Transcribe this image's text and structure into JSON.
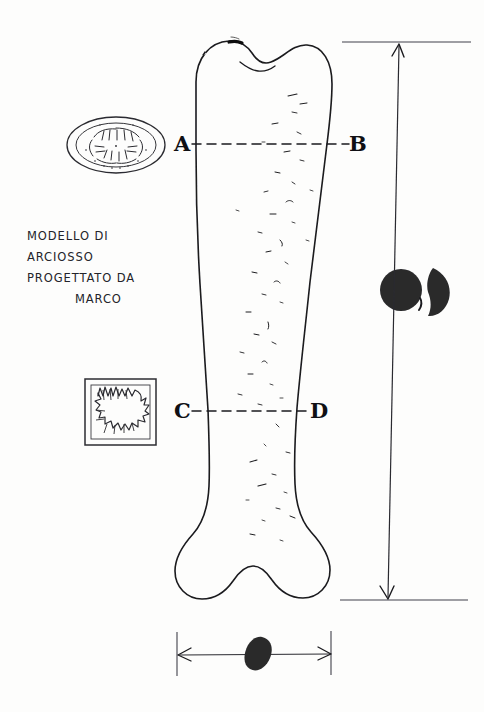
{
  "sheet": {
    "title": "hand-drawn bone model technical sketch",
    "background_color": "#fdfdfc",
    "ink_color": "#1a1a1e",
    "fill_color": "#2a2a2c",
    "width": 484,
    "height": 712
  },
  "annotation": {
    "lines": [
      "MODELLO DI",
      "ARCIOSSO",
      "PROGETTATO DA",
      "MARCO"
    ],
    "line1": "MODELLO DI",
    "line2": "ARCIOSSO",
    "line3": "PROGETTATO DA",
    "line4": "MARCO"
  },
  "labels": {
    "a": "A",
    "b": "B",
    "c": "C",
    "d": "D"
  },
  "sections": {
    "upper": {
      "name": "A-B section line",
      "label_left": "A",
      "label_right": "B",
      "style": "dashed",
      "y": 144
    },
    "lower": {
      "name": "C-D section line",
      "label_left": "C",
      "label_right": "D",
      "style": "dashed",
      "y": 411
    }
  },
  "details": {
    "cross_section_oval": {
      "name": "oval cross-section detail",
      "description": "ellipse with radiating hatch marks"
    },
    "framed_square": {
      "name": "framed jagged detail",
      "description": "square frame containing jagged zigzag blob"
    },
    "solid_circle": {
      "name": "solid filled circle",
      "description": "filled dark disc"
    },
    "crescent": {
      "name": "solid crescent shape",
      "description": "filled dark half-moon"
    },
    "leaf_blob": {
      "name": "solid leaf blob",
      "description": "filled dark pointed oval on width dimension"
    }
  },
  "dimensions": {
    "height": {
      "name": "overall height dimension",
      "orientation": "vertical",
      "arrows": "both-ends",
      "value": ""
    },
    "width": {
      "name": "overall width dimension",
      "orientation": "horizontal",
      "arrows": "both-ends",
      "value": ""
    }
  },
  "object": {
    "name": "bone",
    "description": "long bone with bilobed proximal head and bilobed distal condyles, speckled shaft"
  }
}
